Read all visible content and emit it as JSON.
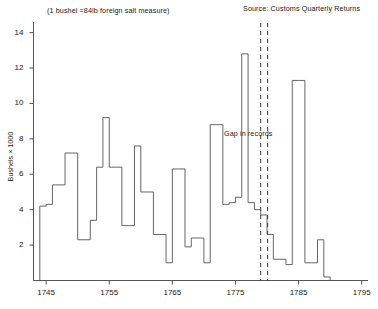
{
  "figure": {
    "subtitle_note": "(1 bushel =84lb foreign salt measure)",
    "source_note": "Source: Customs Quarterly Returns",
    "gap_label": "Gap in records",
    "ylabel": "Bushels × 1000"
  },
  "chart_data": {
    "type": "line",
    "style": "step",
    "title": "",
    "subtitle": "(1 bushel =84lb foreign salt measure)",
    "source": "Source: Customs Quarterly Returns",
    "xlabel": "",
    "ylabel": "Bushels × 1000",
    "xlim": [
      1743,
      1796
    ],
    "ylim": [
      0,
      14.6
    ],
    "xticks": [
      1745,
      1755,
      1765,
      1775,
      1785,
      1795
    ],
    "yticks": [
      2,
      4,
      6,
      8,
      10,
      12,
      14
    ],
    "grid": false,
    "legend": null,
    "line_color": "#555555",
    "annotations": [
      {
        "text": "Gap in records",
        "x": 1779.2,
        "y": 5.4,
        "kind": "gap-annotation"
      },
      {
        "kind": "gap-band",
        "dashed_lines_x": [
          1779.0,
          1780.1
        ],
        "style": "dashed-vertical"
      }
    ],
    "series": [
      {
        "name": "Salt imports",
        "x": [
          1744,
          1745,
          1746,
          1747,
          1748,
          1749,
          1750,
          1751,
          1752,
          1753,
          1754,
          1755,
          1756,
          1757,
          1758,
          1759,
          1760,
          1761,
          1762,
          1763,
          1764,
          1765,
          1766,
          1767,
          1768,
          1769,
          1770,
          1771,
          1772,
          1773,
          1774,
          1775,
          1776,
          1777,
          1778,
          1779,
          1780,
          1781,
          1782,
          1783,
          1784,
          1785,
          1786,
          1787,
          1788,
          1789
        ],
        "values": [
          4.2,
          4.3,
          5.4,
          5.4,
          7.2,
          7.2,
          2.3,
          2.3,
          3.4,
          6.4,
          9.2,
          6.4,
          6.4,
          3.1,
          3.1,
          7.6,
          5.0,
          5.0,
          2.6,
          2.6,
          1.0,
          6.3,
          6.3,
          1.9,
          2.4,
          2.4,
          1.0,
          8.8,
          8.8,
          4.3,
          4.4,
          4.7,
          12.8,
          4.4,
          4.0,
          3.7,
          2.6,
          1.2,
          1.2,
          0.9,
          11.3,
          11.3,
          1.0,
          1.0,
          2.3,
          0.2
        ],
        "note": "approximate annual salt import volumes read from step plot"
      }
    ]
  },
  "axes": {
    "x_tick_labels": [
      "1745",
      "1755",
      "1765",
      "1775",
      "1785",
      "1795"
    ],
    "y_tick_labels": [
      "2",
      "4",
      "6",
      "8",
      "10",
      "12",
      "14"
    ]
  }
}
